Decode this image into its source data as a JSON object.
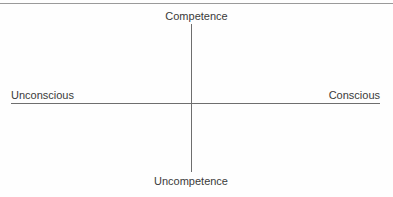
{
  "figure": {
    "background_color": "#fefefe",
    "line_color": "#6e6e6e",
    "rule_color": "#9a9a9a",
    "text_color": "#3a3a3a"
  },
  "top_rule": {
    "present": true
  },
  "axes": {
    "vertical": {
      "top_label": "Competence",
      "bottom_label": "Uncompetence"
    },
    "horizontal": {
      "left_label": "Unconscious",
      "right_label": "Conscious"
    }
  },
  "chart_data": {
    "type": "scatter",
    "title": "",
    "xlabel": "",
    "ylabel": "",
    "grid": false,
    "legend": null,
    "annotations": [
      {
        "text": "Competence",
        "position": "top",
        "axis": "y"
      },
      {
        "text": "Uncompetence",
        "position": "bottom",
        "axis": "y"
      },
      {
        "text": "Unconscious",
        "position": "left",
        "axis": "x"
      },
      {
        "text": "Conscious",
        "position": "right",
        "axis": "x"
      }
    ],
    "series": [],
    "x": [],
    "values": []
  }
}
